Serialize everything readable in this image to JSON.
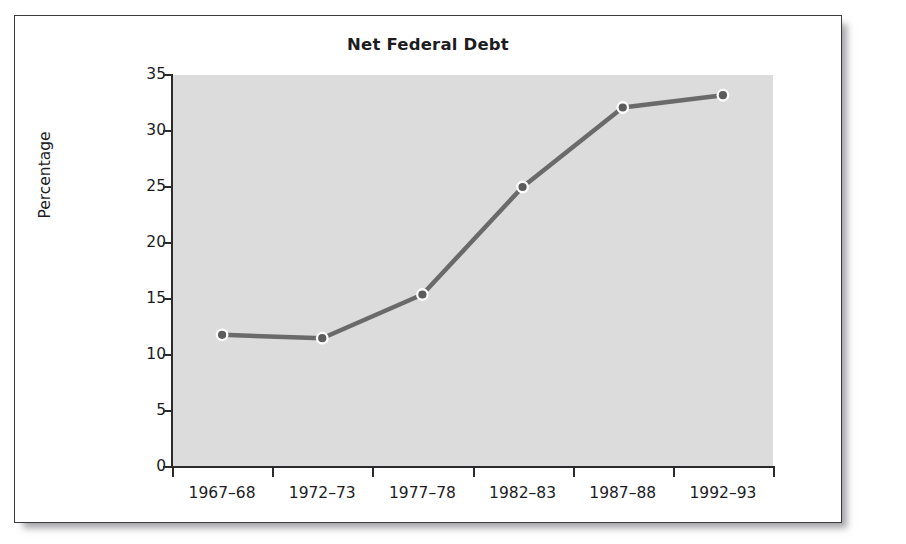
{
  "figure": {
    "title": "Net Federal Debt"
  },
  "chart_data": {
    "type": "line",
    "title": "Net Federal Debt",
    "xlabel": "",
    "ylabel": "Percentage",
    "categories": [
      "1967–68",
      "1972–73",
      "1977–78",
      "1982–83",
      "1987–88",
      "1992–93"
    ],
    "values": [
      11.8,
      11.5,
      15.4,
      25.0,
      32.1,
      33.2
    ],
    "ylim": [
      0,
      35
    ],
    "yticks": [
      0,
      5,
      10,
      15,
      20,
      25,
      30,
      35
    ],
    "ytick_labels": [
      "0",
      "5",
      "10",
      "15",
      "20",
      "25",
      "30",
      "35"
    ],
    "grid": false,
    "legend": null,
    "series": [
      {
        "name": "Net Federal Debt",
        "values": [
          11.8,
          11.5,
          15.4,
          25.0,
          32.1,
          33.2
        ]
      }
    ],
    "colors": {
      "line": "#6a6a6a",
      "marker_fill": "#5c5c5c",
      "marker_ring": "#ffffff",
      "plot_background": "#dcdcdc",
      "axis": "#2b2b2d",
      "text": "#1d1d1f",
      "frame_border": "#3a3a3c"
    }
  }
}
